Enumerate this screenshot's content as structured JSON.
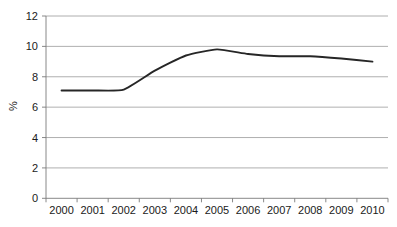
{
  "chart_data": {
    "type": "line",
    "title": "",
    "subtitle": "",
    "xlabel": "",
    "ylabel": "%",
    "categories": [
      "2000",
      "2001",
      "2002",
      "2003",
      "2004",
      "2005",
      "2006",
      "2007",
      "2008",
      "2009",
      "2010"
    ],
    "x": [
      2000,
      2001,
      2002,
      2003,
      2004,
      2005,
      2006,
      2007,
      2008,
      2009,
      2010
    ],
    "series": [
      {
        "name": "",
        "values": [
          7.1,
          7.1,
          7.15,
          8.4,
          9.4,
          9.8,
          9.5,
          9.35,
          9.35,
          9.2,
          9.0
        ]
      }
    ],
    "ylim": [
      0,
      12
    ],
    "yticks": [
      0,
      2,
      4,
      6,
      8,
      10,
      12
    ],
    "ytick_labels": [
      "0",
      "2",
      "4",
      "6",
      "8",
      "10",
      "12"
    ],
    "xtick_labels": [
      "2000",
      "2001",
      "2002",
      "2003",
      "2004",
      "2005",
      "2006",
      "2007",
      "2008",
      "2009",
      "2010"
    ],
    "grid": true,
    "grid_axis": "y",
    "legend": false,
    "legend_position": "none",
    "line_color": "#262626",
    "grid_color": "#9a9a9a",
    "axis_color": "#7a7a7a",
    "background_color": "#ffffff",
    "annotations": []
  }
}
